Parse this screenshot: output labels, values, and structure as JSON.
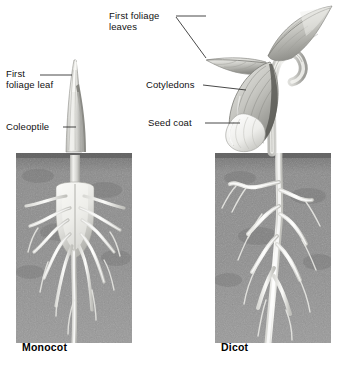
{
  "figure": {
    "background_color": "#ffffff",
    "soil_color": "#8a8a8a",
    "plant_color": "#e8e8e6",
    "line_color": "#1a1a1a"
  },
  "labels": {
    "monocot_leaf": "First\nfoliage leaf",
    "monocot_coleoptile": "Coleoptile",
    "dicot_leaves": "First foliage\nleaves",
    "dicot_cotyledons": "Cotyledons",
    "dicot_seed_coat": "Seed coat"
  },
  "captions": {
    "left": "Monocot",
    "right": "Dicot"
  },
  "panels": {
    "monocot": {
      "soil_block": {
        "x": 16,
        "y": 153,
        "width": 116,
        "height": 190
      }
    },
    "dicot": {
      "soil_block": {
        "x": 215,
        "y": 153,
        "width": 116,
        "height": 190
      }
    }
  }
}
